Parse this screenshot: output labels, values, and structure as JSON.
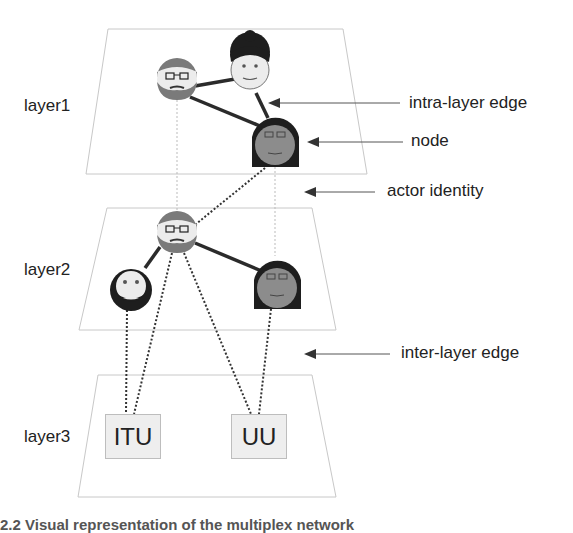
{
  "layers": [
    {
      "label": "layer1"
    },
    {
      "label": "layer2"
    },
    {
      "label": "layer3"
    }
  ],
  "callouts": {
    "intra_layer_edge": "intra-layer edge",
    "node": "node",
    "actor_identity": "actor identity",
    "inter_layer_edge": "inter-layer edge"
  },
  "organizations": [
    {
      "label": "ITU"
    },
    {
      "label": "UU"
    }
  ],
  "nodes": {
    "layer1": [
      "man-glasses-beard",
      "woman-bun",
      "woman-long-hair-glasses"
    ],
    "layer2": [
      "man-glasses-beard",
      "man-beard",
      "woman-long-hair-glasses"
    ],
    "layer3": [
      "ITU",
      "UU"
    ]
  },
  "colors": {
    "plane_border": "#c8c8c8",
    "edge": "#2b2b2b",
    "face_light": "#ececec",
    "face_dark": "#8c8c8c",
    "hair_dark": "#1e1e1e",
    "hair_mid": "#6e6e6e"
  },
  "caption": "2.2 Visual representation of the multiplex network"
}
